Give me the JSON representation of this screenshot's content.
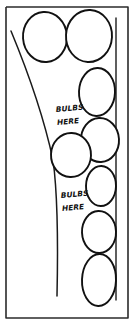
{
  "drawing": {
    "title": "Garden bed planting sketch",
    "background_color": "#ffffff",
    "ink_color": "#111111",
    "frame_color": "#2b2b2b",
    "width": 135,
    "height": 326
  },
  "annotations": [
    {
      "id": "upper",
      "line1": "BULBS",
      "line2": "HERE",
      "x": 56,
      "y": 112
    },
    {
      "id": "lower",
      "line1": "BULBS",
      "line2": "HERE",
      "x": 61,
      "y": 198
    }
  ],
  "frame": {
    "points": "6,7 128,7 128,318 6,318 6,7"
  },
  "bed_edges": {
    "sweeping_curve": "M 11,31 C 28,72 44,118 53,160 C 58,196 58,250 57,296",
    "right_inner_line": "M 116,18 C 116,110 116,215 116,300"
  },
  "plants": [
    {
      "name": "circle-top-left",
      "cx": 45,
      "cy": 37,
      "rx": 22,
      "ry": 25,
      "rot": -4
    },
    {
      "name": "circle-top-right",
      "cx": 89,
      "cy": 36,
      "rx": 23,
      "ry": 26,
      "rot": 3
    },
    {
      "name": "oval-right-upper",
      "cx": 97,
      "cy": 92,
      "rx": 18,
      "ry": 24,
      "rot": 2
    },
    {
      "name": "oval-right-mid",
      "cx": 100,
      "cy": 140,
      "rx": 19,
      "ry": 22,
      "rot": -3
    },
    {
      "name": "circle-center-mid",
      "cx": 71,
      "cy": 155,
      "rx": 20,
      "ry": 22,
      "rot": 2
    },
    {
      "name": "oval-right-lower-mid",
      "cx": 101,
      "cy": 186,
      "rx": 15,
      "ry": 20,
      "rot": 1
    },
    {
      "name": "oval-right-lower",
      "cx": 99,
      "cy": 232,
      "rx": 17,
      "ry": 21,
      "rot": -2
    },
    {
      "name": "oval-bottom-right",
      "cx": 99,
      "cy": 280,
      "rx": 17,
      "ry": 26,
      "rot": 2
    }
  ]
}
